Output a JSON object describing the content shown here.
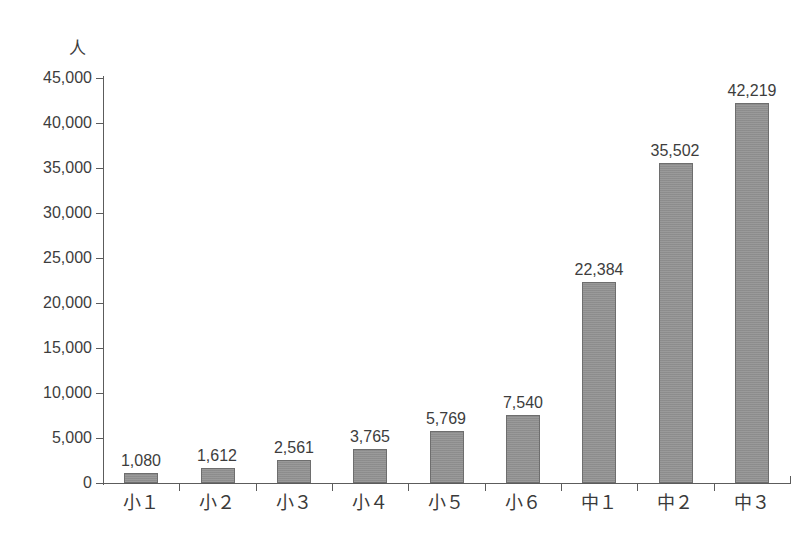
{
  "chart_data": {
    "type": "bar",
    "title": "",
    "subtitle": "",
    "xlabel": "",
    "ylabel": "",
    "unit_label": "人",
    "categories": [
      "小１",
      "小２",
      "小３",
      "小４",
      "小５",
      "小６",
      "中１",
      "中２",
      "中３"
    ],
    "values": [
      1080,
      1612,
      2561,
      3765,
      5769,
      7540,
      22384,
      35502,
      42219
    ],
    "value_labels": [
      "1,080",
      "1,612",
      "2,561",
      "3,765",
      "5,769",
      "7,540",
      "22,384",
      "35,502",
      "42,219"
    ],
    "ylim": [
      0,
      45000
    ],
    "ytick_values": [
      0,
      5000,
      10000,
      15000,
      20000,
      25000,
      30000,
      35000,
      40000,
      45000
    ],
    "ytick_labels": [
      "0",
      "5,000",
      "10,000",
      "15,000",
      "20,000",
      "25,000",
      "30,000",
      "35,000",
      "40,000",
      "45,000"
    ],
    "grid": false,
    "legend": null,
    "bar_color": "#949494",
    "bar_border_color": "#6e6e6e",
    "axis_color": "#5c5c5c",
    "text_color": "#3d3d3d",
    "background_color": "#ffffff"
  },
  "caption": {
    "clipped_text": ""
  }
}
